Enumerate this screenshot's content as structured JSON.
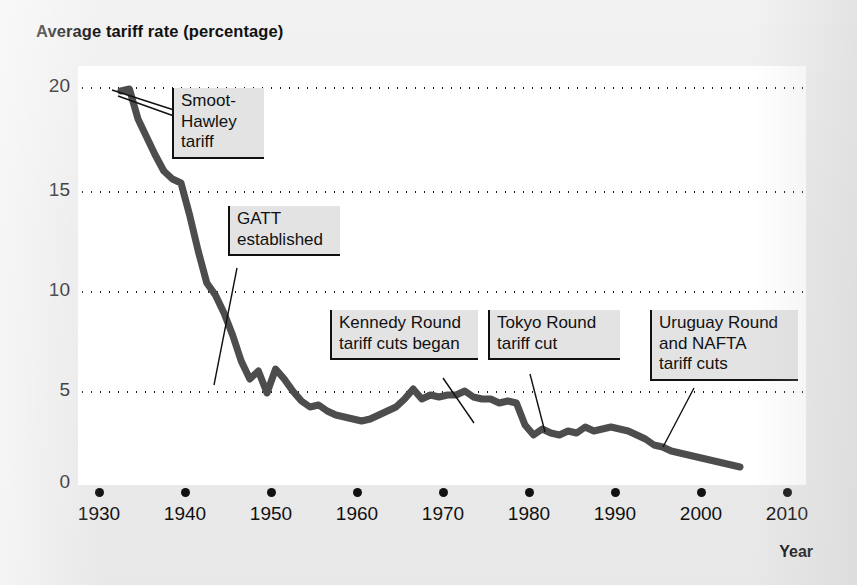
{
  "chart_data": {
    "type": "line",
    "title": "Average tariff rate (percentage)",
    "xlabel": "Year",
    "ylabel": "Average tariff rate (percentage)",
    "xlim": [
      1930,
      2010
    ],
    "ylim": [
      0,
      20
    ],
    "grid": true,
    "legend": "none",
    "x_ticks": [
      1930,
      1940,
      1950,
      1960,
      1970,
      1980,
      1990,
      2000,
      2010
    ],
    "y_ticks": [
      0,
      5,
      10,
      15,
      20
    ],
    "series": [
      {
        "name": "Average tariff rate",
        "color": "#4d4d4d",
        "x": [
          1933,
          1934,
          1935,
          1936,
          1937,
          1938,
          1939,
          1940,
          1941,
          1942,
          1943,
          1944,
          1945,
          1946,
          1947,
          1948,
          1949,
          1950,
          1951,
          1952,
          1953,
          1954,
          1955,
          1956,
          1957,
          1958,
          1959,
          1960,
          1961,
          1962,
          1963,
          1964,
          1965,
          1966,
          1967,
          1968,
          1969,
          1970,
          1971,
          1972,
          1973,
          1974,
          1975,
          1976,
          1977,
          1978,
          1979,
          1980,
          1981,
          1982,
          1983,
          1984,
          1985,
          1986,
          1987,
          1988,
          1989,
          1990,
          1991,
          1992,
          1993,
          1994,
          1995,
          1996,
          1997,
          1998,
          1999,
          2000,
          2001,
          2002,
          2003,
          2004,
          2005
        ],
        "y": [
          19.8,
          19.9,
          18.4,
          17.5,
          16.6,
          15.8,
          15.4,
          15.2,
          13.6,
          11.8,
          10.2,
          9.6,
          8.7,
          7.6,
          6.3,
          5.4,
          5.8,
          4.7,
          5.9,
          5.4,
          4.8,
          4.3,
          4.0,
          4.1,
          3.8,
          3.6,
          3.5,
          3.4,
          3.3,
          3.4,
          3.6,
          3.8,
          4.0,
          4.4,
          4.9,
          4.4,
          4.6,
          4.5,
          4.6,
          4.6,
          4.8,
          4.5,
          4.4,
          4.4,
          4.2,
          4.3,
          4.2,
          3.1,
          2.6,
          2.9,
          2.7,
          2.6,
          2.8,
          2.7,
          3.0,
          2.8,
          2.9,
          3.0,
          2.9,
          2.8,
          2.6,
          2.4,
          2.1,
          2.0,
          1.8,
          1.7,
          1.6,
          1.5,
          1.4,
          1.3,
          1.2,
          1.1,
          1.0
        ]
      }
    ],
    "annotations": [
      {
        "id": "smoot-hawley",
        "label_lines": [
          "Smoot-",
          "Hawley",
          "tariff"
        ],
        "points_to_year": 1934,
        "points_to_value": 19.8
      },
      {
        "id": "gatt",
        "label_lines": [
          "GATT",
          "established"
        ],
        "points_to_year": 1948,
        "points_to_value": 5.2
      },
      {
        "id": "kennedy-round",
        "label_lines": [
          "Kennedy Round",
          "tariff cuts began"
        ],
        "points_to_year": 1973,
        "points_to_value": 4.6
      },
      {
        "id": "tokyo-round",
        "label_lines": [
          "Tokyo Round",
          "tariff cut"
        ],
        "points_to_year": 1980,
        "points_to_value": 3.0
      },
      {
        "id": "uruguay-nafta",
        "label_lines": [
          "Uruguay Round",
          "and NAFTA",
          "tariff cuts"
        ],
        "points_to_year": 1995,
        "points_to_value": 2.1
      }
    ]
  },
  "axes": {
    "y_tick_labels": [
      "20",
      "15",
      "10",
      "5",
      "0"
    ],
    "x_tick_labels": [
      "1930",
      "1940",
      "1950",
      "1960",
      "1970",
      "1980",
      "1990",
      "2000",
      "2010"
    ],
    "x_axis_title": "Year"
  },
  "callouts": {
    "smoot_hawley": {
      "l1": "Smoot-",
      "l2": "Hawley",
      "l3": "tariff"
    },
    "gatt": {
      "l1": "GATT",
      "l2": "established"
    },
    "kennedy": {
      "l1": "Kennedy Round",
      "l2": "tariff cuts began"
    },
    "tokyo": {
      "l1": "Tokyo Round",
      "l2": "tariff cut"
    },
    "uruguay": {
      "l1": "Uruguay Round",
      "l2": "and NAFTA",
      "l3": "tariff cuts"
    }
  },
  "colors": {
    "line": "#4d4d4d",
    "ink": "#111111",
    "callout_bg": "#e3e3e3",
    "page_bg": "#ececec",
    "plot_bg": "#ffffff"
  }
}
